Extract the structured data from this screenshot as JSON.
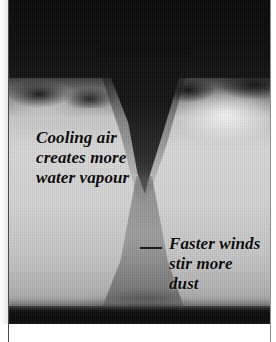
{
  "figure": {
    "type": "photograph",
    "annotations": {
      "left_caption": "Cooling air\ncreates more\nwater vapour",
      "right_caption": "Faster winds\nstir more\ndust"
    }
  },
  "colors": {
    "sky": "#0a0a0a",
    "haze": "#d4d4d4",
    "funnel": "#121212",
    "ground": "#050505",
    "caption_text": "#0c0c0c",
    "page_background": "#ffffff",
    "rule": "#4a4a4a"
  }
}
